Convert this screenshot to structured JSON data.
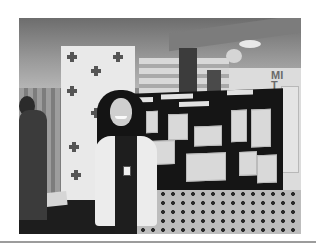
{
  "photo": {
    "description": "Woman standing in front of a trifold poster display board at an indoor health fair booth",
    "wall_text": "MI\nT"
  },
  "colors": {
    "page_background": "#ffffff",
    "divider": "#9c9c9c"
  }
}
